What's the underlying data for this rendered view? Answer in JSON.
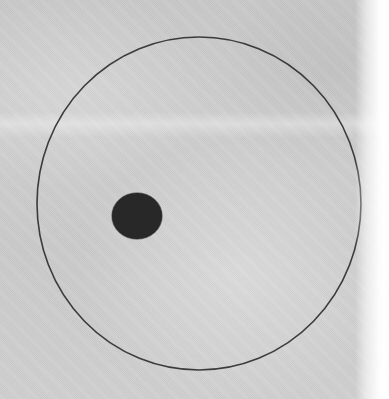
{
  "figure": {
    "title": "Scanned halftone figure: small filled disk inside large circle outline",
    "medium": "grayscale halftone print scan",
    "canvas": {
      "width": 389,
      "height": 399
    },
    "background": {
      "name": "paper-background",
      "base_color": "#cbcbcb",
      "texture": "fine halftone dot screen with paper grain",
      "right_edge_glare_color": "#ffffff",
      "right_edge_glare_width": 34,
      "scan_band_y": 112
    },
    "shapes": [
      {
        "name": "outer-circle",
        "type": "circle-outline",
        "cx": 199,
        "cy": 203.5,
        "rx": 162,
        "ry": 166.5,
        "stroke_color": "#2b2b2b",
        "stroke_width": 1.6,
        "fill": "none"
      },
      {
        "name": "inner-disk",
        "type": "filled-circle",
        "cx": 137,
        "cy": 216,
        "rx": 25,
        "ry": 23,
        "fill_color": "#3a3a3a",
        "stroke_color": "#2e2e2e"
      }
    ],
    "measurements": {
      "outer_circle_left_x": 37,
      "outer_circle_right_x": 361,
      "outer_circle_top_y": 37,
      "outer_circle_bottom_y": 370,
      "inner_disk_left_x": 112,
      "inner_disk_right_x": 162,
      "inner_disk_top_y": 194,
      "inner_disk_bottom_y": 239
    },
    "labels": []
  }
}
